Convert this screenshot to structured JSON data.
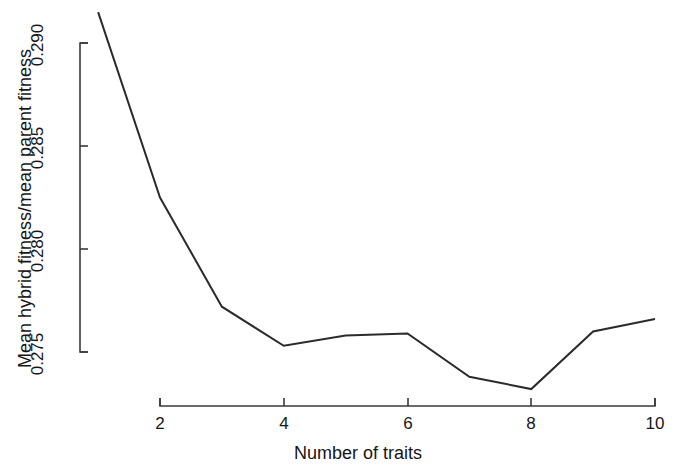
{
  "chart_data": {
    "type": "line",
    "title": "",
    "xlabel": "Number of traits",
    "ylabel": "Mean hybrid fitness/mean parent fitness",
    "x": [
      1,
      2,
      3,
      4,
      5,
      6,
      7,
      8,
      9,
      10
    ],
    "values": [
      0.2915,
      0.2825,
      0.2772,
      0.2753,
      0.2758,
      0.2759,
      0.2738,
      0.2732,
      0.276,
      0.2766
    ],
    "series": [
      {
        "name": "Mean hybrid fitness/mean parent fitness",
        "values": [
          0.2915,
          0.2825,
          0.2772,
          0.2753,
          0.2758,
          0.2759,
          0.2738,
          0.2732,
          0.276,
          0.2766
        ]
      }
    ],
    "xlim": [
      1,
      10
    ],
    "ylim": [
      0.2745,
      0.2915
    ],
    "xticks": [
      2,
      4,
      6,
      8,
      10
    ],
    "xtick_labels": [
      "2",
      "4",
      "6",
      "8",
      "10"
    ],
    "yticks": [
      0.275,
      0.28,
      0.285,
      0.29
    ],
    "ytick_labels": [
      "0.275",
      "0.280",
      "0.285",
      "0.290"
    ],
    "grid": false,
    "legend": false,
    "legend_position": "none",
    "line_color": "#2b2b2b",
    "axis_color": "#3a3a3a",
    "background_color": "#ffffff",
    "markers": false,
    "note": "Line is clipped at the top of the plotting region at x=1."
  },
  "labels": {
    "x_axis_title": "Number of traits",
    "y_axis_title": "Mean hybrid fitness/mean parent fitness",
    "xtick_2": "2",
    "xtick_4": "4",
    "xtick_6": "6",
    "xtick_8": "8",
    "xtick_10": "10",
    "ytick_275": "0.275",
    "ytick_280": "0.280",
    "ytick_285": "0.285",
    "ytick_290": "0.290"
  }
}
